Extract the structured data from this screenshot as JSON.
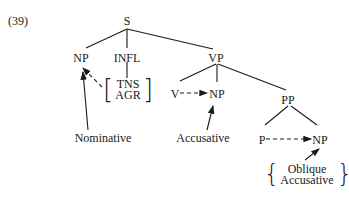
{
  "example_number": "(39)",
  "nodes": {
    "S": "S",
    "NP_subj": "NP",
    "INFL": "INFL",
    "VP": "VP",
    "V": "V",
    "NP_obj": "NP",
    "PP": "PP",
    "P": "P",
    "NP_pobj": "NP"
  },
  "infl_features": [
    "TNS",
    "AGR"
  ],
  "case_labels": {
    "nominative": "Nominative",
    "accusative": "Accusative",
    "oblique": [
      "Oblique",
      "Accusative"
    ]
  },
  "edges": [
    [
      "S",
      "NP_subj"
    ],
    [
      "S",
      "INFL"
    ],
    [
      "S",
      "VP"
    ],
    [
      "INFL",
      "TNS/AGR"
    ],
    [
      "VP",
      "V"
    ],
    [
      "VP",
      "NP_obj"
    ],
    [
      "VP",
      "PP"
    ],
    [
      "PP",
      "P"
    ],
    [
      "PP",
      "NP_pobj"
    ]
  ],
  "case_assignment_arrows": [
    {
      "from": "TNS/AGR",
      "to": "NP_subj",
      "style": "dashed"
    },
    {
      "from": "V",
      "to": "NP_obj",
      "style": "dashed"
    },
    {
      "from": "P",
      "to": "NP_pobj",
      "style": "dashed"
    },
    {
      "from": "Nominative",
      "to": "NP_subj",
      "style": "solid"
    },
    {
      "from": "Accusative",
      "to": "NP_obj",
      "style": "solid"
    },
    {
      "from": "Oblique/Accusative",
      "to": "NP_pobj",
      "style": "solid"
    }
  ]
}
